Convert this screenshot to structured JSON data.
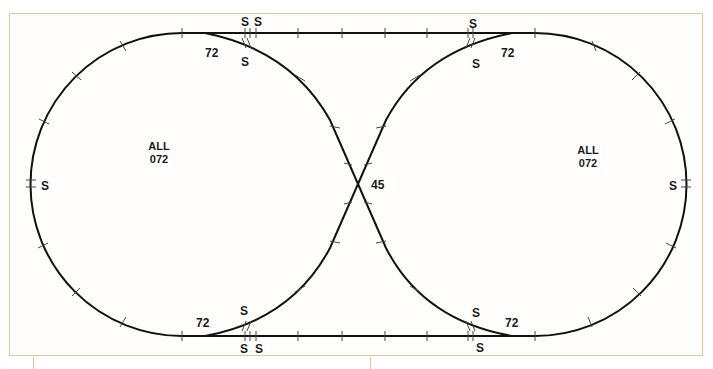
{
  "diagram": {
    "colors": {
      "track": "#111111",
      "border": "#e6c49a",
      "tick": "#555555"
    },
    "loops": [
      {
        "id": "left-loop",
        "label_line1": "ALL",
        "label_line2": "072"
      },
      {
        "id": "right-loop",
        "label_line1": "ALL",
        "label_line2": "072"
      }
    ],
    "crossing": {
      "label": "45"
    },
    "switch_labels": {
      "top_left_radius": "72",
      "top_right_radius": "72",
      "bottom_left_radius": "72",
      "bottom_right_radius": "72"
    },
    "straight_labels": {
      "top_left_s1": "S",
      "top_left_s2": "S",
      "top_left_curve_s": "S",
      "top_right_s": "S",
      "top_right_curve_s": "S",
      "bottom_left_curve_s": "S",
      "bottom_left_s1": "S",
      "bottom_left_s2": "S",
      "bottom_right_curve_s": "S",
      "bottom_right_s": "S",
      "left_side_s": "S",
      "right_side_s": "S"
    }
  }
}
